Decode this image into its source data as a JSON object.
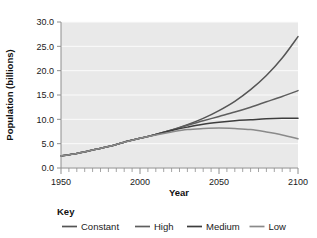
{
  "chart_data": {
    "type": "line",
    "title": "",
    "xlabel": "Year",
    "ylabel": "Population (billions)",
    "xlim": [
      1950,
      2100
    ],
    "ylim": [
      0.0,
      30.0
    ],
    "grid": true,
    "x_ticks": [
      1950,
      2000,
      2050,
      2100
    ],
    "x_tick_labels": [
      "1950",
      "2000",
      "2050",
      "2100"
    ],
    "x_minor_tick_step": 5,
    "y_ticks": [
      0.0,
      5.0,
      10.0,
      15.0,
      20.0,
      25.0,
      30.0
    ],
    "y_tick_labels": [
      "0.0",
      "5.0",
      "10.0",
      "15.0",
      "20.0",
      "25.0",
      "30.0"
    ],
    "legend_title": "Key",
    "legend_position": "below",
    "x": [
      1950,
      1960,
      1970,
      1980,
      1990,
      2000,
      2010,
      2020,
      2030,
      2040,
      2050,
      2060,
      2070,
      2080,
      2090,
      2100
    ],
    "series": [
      {
        "name": "Constant",
        "color": "#555555",
        "values": [
          2.5,
          3.0,
          3.7,
          4.4,
          5.3,
          6.1,
          6.9,
          7.8,
          8.9,
          10.2,
          11.8,
          13.7,
          16.1,
          19.0,
          22.6,
          27.0
        ]
      },
      {
        "name": "High",
        "color": "#5e5e5e",
        "values": [
          2.5,
          3.0,
          3.7,
          4.4,
          5.3,
          6.1,
          6.9,
          7.8,
          8.8,
          9.7,
          10.6,
          11.5,
          12.5,
          13.6,
          14.7,
          15.9
        ]
      },
      {
        "name": "Medium",
        "color": "#3d3d3d",
        "values": [
          2.5,
          3.0,
          3.7,
          4.4,
          5.3,
          6.1,
          6.9,
          7.7,
          8.4,
          9.0,
          9.4,
          9.7,
          9.9,
          10.1,
          10.2,
          10.2
        ]
      },
      {
        "name": "Low",
        "color": "#8a8a8a",
        "values": [
          2.5,
          3.0,
          3.7,
          4.4,
          5.3,
          6.1,
          6.8,
          7.4,
          7.9,
          8.1,
          8.2,
          8.1,
          7.9,
          7.4,
          6.8,
          6.0
        ]
      }
    ]
  },
  "legend": {
    "title": "Key",
    "items": [
      {
        "label": "Constant",
        "color": "#555555"
      },
      {
        "label": "High",
        "color": "#5e5e5e"
      },
      {
        "label": "Medium",
        "color": "#3d3d3d"
      },
      {
        "label": "Low",
        "color": "#8a8a8a"
      }
    ]
  },
  "colors": {
    "plot_background": "#e9e9e9",
    "gridline": "#fbfbfb",
    "axis": "#8e8e8e",
    "text": "#1a1a1a"
  }
}
